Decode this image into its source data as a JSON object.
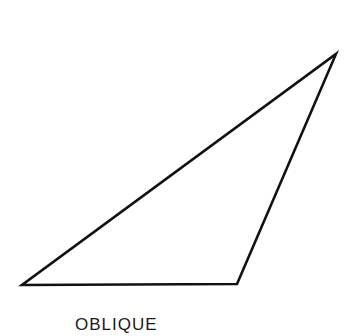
{
  "diagram": {
    "title": "OBLIQUE",
    "shape": "triangle",
    "stroke_color": "#111111",
    "vertices": [
      {
        "x": 22,
        "y": 285
      },
      {
        "x": 237,
        "y": 284
      },
      {
        "x": 336,
        "y": 54
      }
    ]
  }
}
